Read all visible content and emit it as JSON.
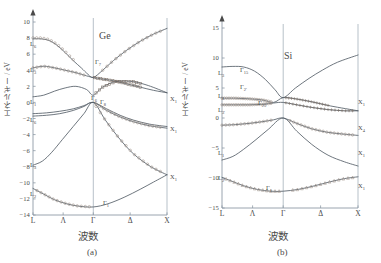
{
  "figure": {
    "caption_a": "(a)",
    "caption_b": "(b)"
  },
  "panel_a": {
    "title": "Ge",
    "ylabel": "エネルギー / eV",
    "xlabel": "波数",
    "yticks": [
      "10",
      "8",
      "6",
      "4",
      "2",
      "0",
      "-2",
      "-4",
      "-6",
      "-8",
      "-10",
      "-12",
      "-14"
    ],
    "xticks": [
      "L",
      "Λ",
      "Γ",
      "Δ",
      "X"
    ],
    "point_labels": [
      {
        "base": "L",
        "sub": "6",
        "x": 30,
        "y": 46
      },
      {
        "base": "L",
        "sub": "3",
        "x": 30,
        "y": 72
      },
      {
        "base": "L",
        "sub": "1",
        "x": 30,
        "y": 104
      },
      {
        "base": "L",
        "sub": "6",
        "x": 30,
        "y": 122
      },
      {
        "base": "L",
        "sub": "3",
        "x": 30,
        "y": 167
      },
      {
        "base": "L",
        "sub": "2",
        "x": 30,
        "y": 196
      },
      {
        "base": "Γ",
        "sub": "7",
        "x": 95,
        "y": 64
      },
      {
        "base": "Γ",
        "sub": "6",
        "x": 91,
        "y": 100
      },
      {
        "base": "Γ",
        "sub": "8",
        "x": 100,
        "y": 104
      },
      {
        "base": "Γ",
        "sub": "1",
        "x": 103,
        "y": 205
      },
      {
        "base": "X",
        "sub": "1",
        "x": 170,
        "y": 101
      },
      {
        "base": "X",
        "sub": "1",
        "x": 170,
        "y": 131
      },
      {
        "base": "X",
        "sub": "1",
        "x": 170,
        "y": 179
      }
    ]
  },
  "panel_b": {
    "title": "Si",
    "ylabel": "エネルギー / eV",
    "xlabel": "波数",
    "yticks": [
      "15",
      "10",
      "5",
      "0",
      "-5",
      "-10",
      "-15"
    ],
    "xticks": [
      "L",
      "Λ",
      "Γ",
      "Δ",
      "X"
    ],
    "point_labels": [
      {
        "base": "Γ",
        "sub": "15",
        "x": 240,
        "y": 72
      },
      {
        "base": "Γ",
        "sub": "2'",
        "x": 240,
        "y": 89
      },
      {
        "base": "Γ",
        "sub": "25'",
        "x": 258,
        "y": 105
      },
      {
        "base": "Γ",
        "sub": "1",
        "x": 266,
        "y": 190
      },
      {
        "base": "L",
        "sub": "3",
        "x": 218,
        "y": 75
      },
      {
        "base": "L",
        "sub": "1",
        "x": 218,
        "y": 98
      },
      {
        "base": "L",
        "sub": "3'",
        "x": 218,
        "y": 112
      },
      {
        "base": "L",
        "sub": "1",
        "x": 218,
        "y": 155
      },
      {
        "base": "L",
        "sub": "2'",
        "x": 218,
        "y": 180
      },
      {
        "base": "X",
        "sub": "1",
        "x": 358,
        "y": 104
      },
      {
        "base": "X",
        "sub": "4",
        "x": 358,
        "y": 130
      },
      {
        "base": "X",
        "sub": "1",
        "x": 358,
        "y": 155
      },
      {
        "base": "X",
        "sub": "1",
        "x": 358,
        "y": 188
      }
    ]
  },
  "chart_data": [
    {
      "type": "line",
      "title": "Ge",
      "xlabel": "波数",
      "ylabel": "エネルギー / eV",
      "xlim": [
        0,
        1
      ],
      "ylim": [
        -14,
        10
      ],
      "xtick_labels": [
        "L",
        "Λ",
        "Γ",
        "Δ",
        "X"
      ],
      "xtick_positions": [
        0.0,
        0.225,
        0.45,
        0.725,
        1.0
      ],
      "ytick_values": [
        10,
        8,
        6,
        4,
        2,
        0,
        -2,
        -4,
        -6,
        -8,
        -10,
        -12,
        -14
      ],
      "grid": false,
      "legend": null,
      "annotations": [
        "L6",
        "L3",
        "L1",
        "L6",
        "L3",
        "L2",
        "Γ7",
        "Γ6",
        "Γ8",
        "Γ1",
        "X1",
        "X1",
        "X1"
      ],
      "series": [
        {
          "name": "cb-upper (L6 8eV -> Γ7 -> rising to X)",
          "x": [
            0.0,
            0.06,
            0.12,
            0.18,
            0.24,
            0.3,
            0.36,
            0.41,
            0.45,
            0.52,
            0.6,
            0.7,
            0.8,
            0.9,
            1.0
          ],
          "y": [
            7.9,
            7.9,
            7.7,
            7.1,
            6.2,
            5.2,
            4.3,
            3.5,
            3.1,
            4.0,
            5.2,
            6.5,
            7.6,
            8.5,
            9.2
          ]
        },
        {
          "name": "cb-mid (L3 4.2eV -> Γ7 3.1 -> X1 1.2)",
          "x": [
            0.0,
            0.08,
            0.16,
            0.24,
            0.32,
            0.4,
            0.45,
            0.52,
            0.6,
            0.7,
            0.8,
            0.9,
            1.0
          ],
          "y": [
            4.3,
            4.5,
            4.3,
            4.0,
            3.7,
            3.3,
            3.1,
            2.9,
            2.7,
            2.3,
            1.9,
            1.5,
            1.2
          ]
        },
        {
          "name": "cb-lowest (L1 0.7eV -> Γ6 -> X1 1.2)",
          "x": [
            0.0,
            0.08,
            0.16,
            0.24,
            0.32,
            0.4,
            0.45,
            0.52,
            0.62,
            0.74,
            0.86,
            1.0
          ],
          "y": [
            0.7,
            0.9,
            1.4,
            1.8,
            2.0,
            1.6,
            0.9,
            1.9,
            2.6,
            2.6,
            2.1,
            1.2
          ]
        },
        {
          "name": "vb-heavy (L6 -1.4 -> Γ8 0 -> X4 -3.0)",
          "x": [
            0.0,
            0.1,
            0.2,
            0.3,
            0.38,
            0.45,
            0.55,
            0.65,
            0.75,
            0.87,
            1.0
          ],
          "y": [
            -1.4,
            -1.3,
            -1.1,
            -0.8,
            -0.4,
            0.0,
            -0.8,
            -1.6,
            -2.2,
            -2.7,
            -3.0
          ]
        },
        {
          "name": "vb-light (L6 -1.6 -> Γ8 0 -> X4 -3.1)",
          "x": [
            0.0,
            0.1,
            0.2,
            0.3,
            0.38,
            0.45,
            0.55,
            0.65,
            0.75,
            0.87,
            1.0
          ],
          "y": [
            -1.7,
            -1.6,
            -1.4,
            -1.0,
            -0.5,
            0.0,
            -1.0,
            -1.8,
            -2.4,
            -2.9,
            -3.2
          ]
        },
        {
          "name": "vb-split-off (L3 -7.8 -> Γ8 0 -> X1 -9.0)",
          "x": [
            0.0,
            0.07,
            0.14,
            0.22,
            0.3,
            0.38,
            0.45,
            0.54,
            0.64,
            0.75,
            0.88,
            1.0
          ],
          "y": [
            -7.8,
            -7.3,
            -6.2,
            -4.6,
            -3.0,
            -1.4,
            0.0,
            -2.2,
            -4.4,
            -6.4,
            -8.0,
            -9.0
          ]
        },
        {
          "name": "vb-bottom (L2 -10.7 -> Γ1 -13.0 -> X1 -9.0)",
          "x": [
            0.0,
            0.08,
            0.16,
            0.25,
            0.34,
            0.45,
            0.56,
            0.68,
            0.8,
            0.9,
            1.0
          ],
          "y": [
            -10.7,
            -11.4,
            -12.1,
            -12.6,
            -12.9,
            -13.0,
            -12.6,
            -11.8,
            -10.8,
            -9.9,
            -9.0
          ]
        }
      ]
    },
    {
      "type": "line",
      "title": "Si",
      "xlabel": "波数",
      "ylabel": "エネルギー / eV",
      "xlim": [
        0,
        1
      ],
      "ylim": [
        -15,
        15
      ],
      "xtick_labels": [
        "L",
        "Λ",
        "Γ",
        "Δ",
        "X"
      ],
      "xtick_positions": [
        0.0,
        0.225,
        0.45,
        0.725,
        1.0
      ],
      "ytick_values": [
        15,
        10,
        5,
        0,
        -5,
        -10,
        -15
      ],
      "grid": false,
      "legend": null,
      "annotations": [
        "L3",
        "L1",
        "L3'",
        "L1",
        "L2'",
        "Γ15",
        "Γ2'",
        "Γ25'",
        "Γ1",
        "X1",
        "X4",
        "X1",
        "X1"
      ],
      "series": [
        {
          "name": "cb-upper (L 8.5 -> Γ15 3.4 -> X 10.5)",
          "x": [
            0.0,
            0.08,
            0.16,
            0.24,
            0.32,
            0.39,
            0.45,
            0.54,
            0.64,
            0.74,
            0.85,
            1.0
          ],
          "y": [
            8.5,
            8.6,
            8.5,
            7.8,
            6.4,
            4.7,
            3.4,
            5.0,
            6.6,
            8.0,
            9.3,
            10.5
          ]
        },
        {
          "name": "cb-mid (L3 3.2 -> Γ15 3.4 -> X1 1.2)",
          "x": [
            0.0,
            0.1,
            0.2,
            0.3,
            0.38,
            0.45,
            0.54,
            0.66,
            0.8,
            1.0
          ],
          "y": [
            3.3,
            3.3,
            3.2,
            3.0,
            2.6,
            3.4,
            3.2,
            2.7,
            2.0,
            1.2
          ]
        },
        {
          "name": "cb-lowest (L1 2.2 -> Γ2' 2.6 -> X1 1.2)",
          "x": [
            0.0,
            0.1,
            0.2,
            0.3,
            0.38,
            0.45,
            0.55,
            0.65,
            0.78,
            0.9,
            1.0
          ],
          "y": [
            2.2,
            2.2,
            2.2,
            2.3,
            2.5,
            2.6,
            2.2,
            1.8,
            1.4,
            1.2,
            1.2
          ]
        },
        {
          "name": "vb-upper (L3' -1.2 -> Γ25' 0 -> X4 -2.9)",
          "x": [
            0.0,
            0.1,
            0.2,
            0.3,
            0.38,
            0.45,
            0.55,
            0.66,
            0.78,
            0.9,
            1.0
          ],
          "y": [
            -1.2,
            -1.1,
            -0.9,
            -0.6,
            -0.3,
            0.0,
            -0.9,
            -1.8,
            -2.4,
            -2.7,
            -2.9
          ]
        },
        {
          "name": "vb-mid (L1 -7.0 -> Γ25' 0 -> X1 -8.0)",
          "x": [
            0.0,
            0.08,
            0.16,
            0.25,
            0.34,
            0.45,
            0.55,
            0.66,
            0.78,
            0.9,
            1.0
          ],
          "y": [
            -7.0,
            -6.4,
            -5.2,
            -3.6,
            -1.9,
            0.0,
            -2.2,
            -4.4,
            -6.2,
            -7.3,
            -8.0
          ]
        },
        {
          "name": "vb-bottom (L2' -9.9 -> Γ1 -12.2 -> X1 -9.8)",
          "x": [
            0.0,
            0.08,
            0.16,
            0.26,
            0.36,
            0.45,
            0.56,
            0.68,
            0.8,
            0.9,
            1.0
          ],
          "y": [
            -9.9,
            -10.6,
            -11.3,
            -11.9,
            -12.2,
            -12.2,
            -11.9,
            -11.3,
            -10.6,
            -10.1,
            -9.8
          ]
        }
      ]
    }
  ]
}
